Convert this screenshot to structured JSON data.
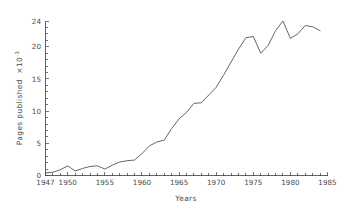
{
  "chart_data": {
    "type": "line",
    "title": "",
    "xlabel": "Years",
    "ylabel": "Pages published",
    "ylabel_multiplier": "×10",
    "ylabel_exponent": "-3",
    "xlim": [
      1947,
      1985
    ],
    "ylim": [
      0,
      24
    ],
    "grid": false,
    "legend": "none",
    "y_ticks": [
      0,
      5,
      10,
      15,
      20,
      24
    ],
    "y_tick_labels": [
      "0",
      "5",
      "10",
      "15",
      "20",
      "24"
    ],
    "x_ticks": [
      1947,
      1950,
      1955,
      1960,
      1965,
      1970,
      1975,
      1980,
      1985
    ],
    "x_tick_labels": [
      "1947",
      "1950",
      "1955",
      "1960",
      "1965",
      "1970",
      "1975",
      "1980",
      "1985"
    ],
    "x_minor_tick_step": 1,
    "line_color": "#4a4a4a",
    "x": [
      1947,
      1948,
      1949,
      1950,
      1951,
      1952,
      1953,
      1954,
      1955,
      1956,
      1957,
      1958,
      1959,
      1960,
      1961,
      1962,
      1963,
      1964,
      1965,
      1966,
      1967,
      1968,
      1969,
      1970,
      1971,
      1972,
      1973,
      1974,
      1975,
      1976,
      1977,
      1978,
      1979,
      1980,
      1981,
      1982,
      1983,
      1984
    ],
    "y": [
      0.4,
      0.5,
      0.9,
      1.5,
      0.7,
      1.1,
      1.4,
      1.5,
      1.0,
      1.6,
      2.1,
      2.3,
      2.4,
      3.4,
      4.6,
      5.2,
      5.5,
      7.3,
      8.8,
      9.8,
      11.2,
      11.3,
      12.5,
      13.7,
      15.6,
      17.6,
      19.6,
      21.4,
      21.6,
      19.0,
      20.2,
      22.5,
      24.0,
      21.3,
      22.0,
      23.3,
      23.1,
      22.5,
      22.3,
      21.0
    ]
  },
  "series_note": {
    "points": [
      {
        "year": 1947,
        "value": 0.4
      },
      {
        "year": 1948,
        "value": 0.5
      },
      {
        "year": 1949,
        "value": 0.9
      },
      {
        "year": 1950,
        "value": 1.5
      },
      {
        "year": 1951,
        "value": 0.7
      },
      {
        "year": 1952,
        "value": 1.1
      },
      {
        "year": 1953,
        "value": 1.4
      },
      {
        "year": 1954,
        "value": 1.5
      },
      {
        "year": 1955,
        "value": 1.0
      },
      {
        "year": 1956,
        "value": 1.6
      },
      {
        "year": 1957,
        "value": 2.1
      },
      {
        "year": 1958,
        "value": 2.3
      },
      {
        "year": 1959,
        "value": 2.4
      },
      {
        "year": 1960,
        "value": 3.4
      },
      {
        "year": 1961,
        "value": 4.6
      },
      {
        "year": 1962,
        "value": 5.2
      },
      {
        "year": 1963,
        "value": 5.5
      },
      {
        "year": 1964,
        "value": 7.3
      },
      {
        "year": 1965,
        "value": 8.8
      },
      {
        "year": 1966,
        "value": 9.8
      },
      {
        "year": 1967,
        "value": 11.2
      },
      {
        "year": 1968,
        "value": 11.3
      },
      {
        "year": 1969,
        "value": 12.5
      },
      {
        "year": 1970,
        "value": 13.7
      },
      {
        "year": 1971,
        "value": 15.6
      },
      {
        "year": 1972,
        "value": 17.6
      },
      {
        "year": 1973,
        "value": 19.6
      },
      {
        "year": 1974,
        "value": 21.4
      },
      {
        "year": 1975,
        "value": 21.6
      },
      {
        "year": 1976,
        "value": 19.0
      },
      {
        "year": 1977,
        "value": 20.2
      },
      {
        "year": 1978,
        "value": 22.5
      },
      {
        "year": 1979,
        "value": 24.0
      },
      {
        "year": 1980,
        "value": 21.3
      },
      {
        "year": 1981,
        "value": 22.0
      },
      {
        "year": 1982,
        "value": 23.3
      },
      {
        "year": 1983,
        "value": 23.1
      },
      {
        "year": 1984,
        "value": 22.5
      }
    ]
  }
}
